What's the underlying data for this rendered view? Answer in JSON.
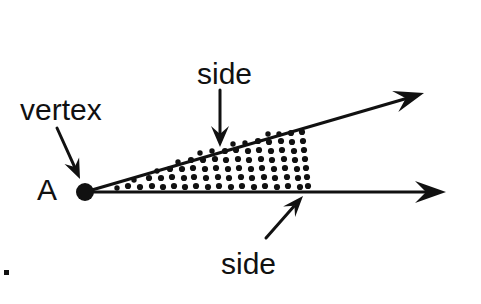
{
  "figure": {
    "background_color": "#ffffff",
    "ink_color": "#111111",
    "width": 481,
    "height": 304
  },
  "labels": {
    "vertex_label": "vertex",
    "point_label": "A",
    "side_top_label": "side",
    "side_bottom_label": "side"
  },
  "geometry": {
    "vertex": {
      "x": 85,
      "y": 192,
      "radius": 9
    },
    "ray_upper": {
      "x1": 85,
      "y1": 192,
      "x2": 408,
      "y2": 98
    },
    "ray_lower": {
      "x1": 85,
      "y1": 192,
      "x2": 430,
      "y2": 192
    },
    "arrow_upper_tip": {
      "x": 424,
      "y": 93
    },
    "arrow_lower_tip": {
      "x": 446,
      "y": 192
    },
    "stipple_right_edge": 312
  },
  "leaders": {
    "vertex_leader": {
      "x1": 57,
      "y1": 128,
      "x2": 80,
      "y2": 179
    },
    "side_top_leader": {
      "x1": 220,
      "y1": 90,
      "x2": 220,
      "y2": 147
    },
    "side_bottom_leader": {
      "x1": 266,
      "y1": 238,
      "x2": 303,
      "y2": 196
    }
  },
  "label_positions": {
    "vertex_label": {
      "x": 20,
      "y": 120
    },
    "point_label": {
      "x": 37,
      "y": 200
    },
    "side_top_label": {
      "x": 197,
      "y": 84
    },
    "side_bottom_label": {
      "x": 221,
      "y": 274
    }
  },
  "stipple_dots": [
    {
      "x": 128,
      "y": 186,
      "r": 3.1
    },
    {
      "x": 140,
      "y": 187,
      "r": 3.1
    },
    {
      "x": 152,
      "y": 186,
      "r": 3.1
    },
    {
      "x": 149,
      "y": 178,
      "r": 3.1
    },
    {
      "x": 163,
      "y": 187,
      "r": 3.1
    },
    {
      "x": 161,
      "y": 178,
      "r": 3.1
    },
    {
      "x": 174,
      "y": 186,
      "r": 3.1
    },
    {
      "x": 172,
      "y": 177,
      "r": 3.1
    },
    {
      "x": 170,
      "y": 169,
      "r": 3.1
    },
    {
      "x": 185,
      "y": 187,
      "r": 3.1
    },
    {
      "x": 184,
      "y": 178,
      "r": 3.1
    },
    {
      "x": 182,
      "y": 169,
      "r": 3.1
    },
    {
      "x": 196,
      "y": 186,
      "r": 3.1
    },
    {
      "x": 194,
      "y": 177,
      "r": 3.1
    },
    {
      "x": 193,
      "y": 168,
      "r": 3.1
    },
    {
      "x": 191,
      "y": 160,
      "r": 3.1
    },
    {
      "x": 208,
      "y": 187,
      "r": 3.1
    },
    {
      "x": 206,
      "y": 178,
      "r": 3.1
    },
    {
      "x": 205,
      "y": 169,
      "r": 3.1
    },
    {
      "x": 203,
      "y": 160,
      "r": 3.1
    },
    {
      "x": 219,
      "y": 186,
      "r": 3.1
    },
    {
      "x": 218,
      "y": 177,
      "r": 3.1
    },
    {
      "x": 216,
      "y": 168,
      "r": 3.1
    },
    {
      "x": 215,
      "y": 159,
      "r": 3.1
    },
    {
      "x": 231,
      "y": 187,
      "r": 3.1
    },
    {
      "x": 229,
      "y": 178,
      "r": 3.1
    },
    {
      "x": 228,
      "y": 169,
      "r": 3.1
    },
    {
      "x": 226,
      "y": 160,
      "r": 3.1
    },
    {
      "x": 225,
      "y": 151,
      "r": 3.1
    },
    {
      "x": 242,
      "y": 186,
      "r": 3.1
    },
    {
      "x": 241,
      "y": 177,
      "r": 3.1
    },
    {
      "x": 239,
      "y": 168,
      "r": 3.1
    },
    {
      "x": 238,
      "y": 159,
      "r": 3.1
    },
    {
      "x": 236,
      "y": 150,
      "r": 3.1
    },
    {
      "x": 254,
      "y": 187,
      "r": 3.1
    },
    {
      "x": 252,
      "y": 178,
      "r": 3.1
    },
    {
      "x": 251,
      "y": 169,
      "r": 3.1
    },
    {
      "x": 249,
      "y": 160,
      "r": 3.1
    },
    {
      "x": 248,
      "y": 151,
      "r": 3.1
    },
    {
      "x": 265,
      "y": 186,
      "r": 3.1
    },
    {
      "x": 264,
      "y": 177,
      "r": 3.1
    },
    {
      "x": 262,
      "y": 168,
      "r": 3.1
    },
    {
      "x": 261,
      "y": 159,
      "r": 3.1
    },
    {
      "x": 259,
      "y": 150,
      "r": 3.1
    },
    {
      "x": 258,
      "y": 141,
      "r": 3.1
    },
    {
      "x": 277,
      "y": 187,
      "r": 3.1
    },
    {
      "x": 275,
      "y": 178,
      "r": 3.1
    },
    {
      "x": 274,
      "y": 169,
      "r": 3.1
    },
    {
      "x": 272,
      "y": 160,
      "r": 3.1
    },
    {
      "x": 271,
      "y": 151,
      "r": 3.1
    },
    {
      "x": 269,
      "y": 142,
      "r": 3.1
    },
    {
      "x": 288,
      "y": 186,
      "r": 3.1
    },
    {
      "x": 287,
      "y": 177,
      "r": 3.1
    },
    {
      "x": 285,
      "y": 168,
      "r": 3.1
    },
    {
      "x": 284,
      "y": 159,
      "r": 3.1
    },
    {
      "x": 282,
      "y": 150,
      "r": 3.1
    },
    {
      "x": 281,
      "y": 141,
      "r": 3.1
    },
    {
      "x": 300,
      "y": 187,
      "r": 3.1
    },
    {
      "x": 298,
      "y": 178,
      "r": 3.1
    },
    {
      "x": 297,
      "y": 169,
      "r": 3.1
    },
    {
      "x": 295,
      "y": 160,
      "r": 3.1
    },
    {
      "x": 294,
      "y": 151,
      "r": 3.1
    },
    {
      "x": 292,
      "y": 142,
      "r": 3.1
    },
    {
      "x": 291,
      "y": 133,
      "r": 3.1
    },
    {
      "x": 308,
      "y": 186,
      "r": 3.1
    },
    {
      "x": 307,
      "y": 177,
      "r": 3.1
    },
    {
      "x": 306,
      "y": 168,
      "r": 3.1
    },
    {
      "x": 305,
      "y": 159,
      "r": 3.1
    },
    {
      "x": 304,
      "y": 150,
      "r": 3.1
    },
    {
      "x": 303,
      "y": 141,
      "r": 3.1
    },
    {
      "x": 302,
      "y": 132,
      "r": 3.1
    },
    {
      "x": 117,
      "y": 188,
      "r": 2.7
    },
    {
      "x": 134,
      "y": 180,
      "r": 2.7
    },
    {
      "x": 157,
      "y": 171,
      "r": 2.7
    },
    {
      "x": 178,
      "y": 162,
      "r": 2.7
    },
    {
      "x": 200,
      "y": 153,
      "r": 2.7
    },
    {
      "x": 212,
      "y": 151,
      "r": 2.7
    },
    {
      "x": 245,
      "y": 143,
      "r": 2.7
    },
    {
      "x": 233,
      "y": 144,
      "r": 2.7
    },
    {
      "x": 279,
      "y": 134,
      "r": 2.7
    },
    {
      "x": 268,
      "y": 134,
      "r": 2.7
    }
  ],
  "corner_mark": {
    "x": 4,
    "y": 270,
    "size": 5
  }
}
